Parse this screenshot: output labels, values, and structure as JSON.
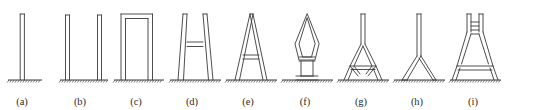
{
  "figure": {
    "kind": "structural-topology-diagram",
    "width": 535,
    "height": 110,
    "background_color": "#ffffff",
    "stroke_color": "#3a3a3a",
    "ground_color": "#3a3a3a",
    "baseline_y": 80,
    "caption_row_y": 96,
    "panel_count": 9
  },
  "panels": [
    {
      "id": "a",
      "label": "(a)",
      "label_x": 22,
      "description": "single slender vertical column on fixed ground support",
      "center_x": 25,
      "ground": {
        "x1": 8,
        "x2": 42,
        "y": 80
      },
      "outlines": [
        "M20.2,14 L20.2,80 M24.4,14 L24.4,80 M20.2,14 L24.4,14"
      ],
      "members": []
    },
    {
      "id": "b",
      "label": "(b)",
      "label_x": 80,
      "description": "two separate slender vertical columns on a shared ground support",
      "center_x": 83,
      "ground": {
        "x1": 60,
        "x2": 108,
        "y": 80
      },
      "outlines": [
        "M65.5,15 L65.5,80 M69.5,15 L69.5,80 M65.5,15 L69.5,15",
        "M97.5,15 L97.5,80 M101.5,15 L101.5,80 M97.5,15 L101.5,15"
      ],
      "members": []
    },
    {
      "id": "c",
      "label": "(c)",
      "label_x": 136,
      "description": "portal frame: two vertical columns joined by a horizontal top beam",
      "center_x": 139,
      "ground": {
        "x1": 114,
        "x2": 164,
        "y": 80
      },
      "outlines": [
        "M121,14 L121,80 M125.5,18.5 L125.5,80 M152.5,14 L152.5,80 M148,18.5 L148,80 M121,14 L152.5,14 M125.5,18.5 L148,18.5"
      ],
      "members": []
    },
    {
      "id": "d",
      "label": "(d)",
      "label_x": 192,
      "description": "trapezoidal splayed frame with two vertical top posts and a horizontal crossbar",
      "center_x": 195,
      "ground": {
        "x1": 170,
        "x2": 221,
        "y": 80
      },
      "outlines": [
        "M183,14 L178,80 M187,14 L183.5,80 M183,14 L187,14",
        "M203,14 L208.5,80 M207,14 L213,80 M203,14 L207,14",
        "M187,42 L203,42 M187,46.5 L203,46.5"
      ],
      "members": []
    },
    {
      "id": "e",
      "label": "(e)",
      "label_x": 248,
      "description": "A-frame triangle with apex at top and a horizontal tie crossbar",
      "center_x": 251,
      "ground": {
        "x1": 226,
        "x2": 277,
        "y": 80
      },
      "outlines": [
        "M250,14 L235,80 M253,14 L239.5,80 M250,14 L253,14",
        "M253,14 L267,80 M250,14 L263,80",
        "M243,55 L259,55 M243,59 L259,59"
      ],
      "members": []
    },
    {
      "id": "f",
      "label": "(f)",
      "label_x": 305,
      "description": "lens/diamond profile on a narrow pedestal with a horizontal crossbar",
      "center_x": 307,
      "ground": {
        "x1": 282,
        "x2": 333,
        "y": 80
      },
      "outlines": [
        "M307,14 L295,44 L299,60 L307,60 L315,60 L319,44 Z",
        "M307,18 L299,44 L302.5,57 L307,57 L311.5,57 L315,44 Z",
        "M299,57 L315,57 M299,61 L315,61",
        "M301,61 L301,76 M313,61 L313,76 M301,76 L313,76",
        "M296,76 L318,76 M296,80 L318,80"
      ],
      "members": []
    },
    {
      "id": "g",
      "label": "(g)",
      "label_x": 361,
      "description": "slender top column opening into a diamond with splayed feet",
      "center_x": 363,
      "ground": {
        "x1": 338,
        "x2": 389,
        "y": 80
      },
      "outlines": [
        "M361,14 L361,44 M365,14 L365,44 M361,14 L365,14",
        "M361,44 L350,66 L358,76 M365,44 L376,66 L368,76",
        "M363,46 L354,66 L360,74 M363,46 L372,66 L366,74",
        "M350,66 L376,66 M351,69.5 L375,69.5",
        "M350,66 L344,80 M376,66 L382,80",
        "M353,68 L348,80 M373,68 L378,80"
      ],
      "members": []
    },
    {
      "id": "h",
      "label": "(h)",
      "label_x": 417,
      "description": "vertical column bifurcating into two splayed legs near the base",
      "center_x": 419,
      "ground": {
        "x1": 394,
        "x2": 445,
        "y": 80
      },
      "outlines": [
        "M417,14 L417,56 M421,14 L421,56 M417,14 L421,14",
        "M417,56 L402,80 M421,56 L407,80 M402,80 L407,80",
        "M419,58 L433,80 M421,56 L436,80 M433,80 L436,80"
      ],
      "members": []
    },
    {
      "id": "i",
      "label": "(i)",
      "label_x": 473,
      "description": "trapezoid with twin top posts and multiple horizontal crossbars",
      "center_x": 475,
      "ground": {
        "x1": 450,
        "x2": 501,
        "y": 80
      },
      "outlines": [
        "M467,14 L467,32 M471,14 L471,32 M467,14 L471,14",
        "M479,14 L479,32 M483,14 L483,32 M479,14 L483,14",
        "M471,22 L479,22 M471,26 L479,26",
        "M471,30 L479,30 M471,34 L479,34",
        "M467,32 L457,66 M471,34 L461.5,64 M483,32 L493,66 M479,34 L488.5,64",
        "M457,66 L493,66 M458,70 L492,70",
        "M457,66 L452,80 M493,66 L498,80 M460,68 L456,80 M490,68 L494,80"
      ],
      "members": []
    }
  ]
}
